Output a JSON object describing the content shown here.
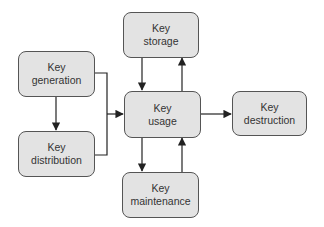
{
  "diagram": {
    "nodes": {
      "generation": {
        "line1": "Key",
        "line2": "generation"
      },
      "distribution": {
        "line1": "Key",
        "line2": "distribution"
      },
      "storage": {
        "line1": "Key",
        "line2": "storage"
      },
      "usage": {
        "line1": "Key",
        "line2": "usage"
      },
      "maintenance": {
        "line1": "Key",
        "line2": "maintenance"
      },
      "destruction": {
        "line1": "Key",
        "line2": "destruction"
      }
    },
    "edges": [
      {
        "from": "generation",
        "to": "distribution"
      },
      {
        "from": "generation",
        "to": "usage"
      },
      {
        "from": "distribution",
        "to": "usage"
      },
      {
        "from": "storage",
        "to": "usage"
      },
      {
        "from": "usage",
        "to": "storage"
      },
      {
        "from": "usage",
        "to": "maintenance"
      },
      {
        "from": "maintenance",
        "to": "usage"
      },
      {
        "from": "usage",
        "to": "destruction"
      }
    ],
    "colors": {
      "node_fill": "#e3e3e3",
      "node_border": "#555555",
      "edge": "#222222",
      "text": "#333333"
    }
  }
}
